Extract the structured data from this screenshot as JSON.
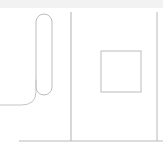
{
  "document": {
    "title": "Line Drawing",
    "width": 163,
    "height": 152,
    "background_color": "#ffffff"
  },
  "style": {
    "stroke_color": "#b9b9b9",
    "stroke_color_dark": "#a8a8a8",
    "stroke_color_light": "#cfcfcf",
    "stroke_width": 1,
    "fill": "none",
    "top_band_color": "#f2f2f2"
  },
  "shapes": {
    "top_band": {
      "name": "top-edge-band",
      "x": 0,
      "y": 0,
      "width": 163,
      "height": 8,
      "color": "#f2f2f2"
    },
    "capsule": {
      "name": "capsule-outline",
      "x": 36,
      "y": 14,
      "width": 16,
      "height": 81,
      "radius": 8,
      "stroke": "#bcbcbc"
    },
    "sweep_curve": {
      "name": "sweeping-curve",
      "path": "M 36 80 L 36 92 Q 36 105 21 105 L 0 105",
      "stroke": "#c4c4c4",
      "start": [
        36,
        80
      ],
      "end": [
        0,
        105
      ]
    },
    "center_vertical_line": {
      "name": "center-vertical-line",
      "x1": 71,
      "y1": 12,
      "x2": 71,
      "y2": 141,
      "stroke": "#b0b0b0"
    },
    "right_vertical_line": {
      "name": "right-vertical-line",
      "x1": 157,
      "y1": 12,
      "x2": 157,
      "y2": 141,
      "stroke": "#b8b8b8"
    },
    "bottom_horizontal_line": {
      "name": "bottom-horizontal-line",
      "x1": 19,
      "y1": 141,
      "x2": 163,
      "y2": 141,
      "stroke": "#b8b8b8"
    },
    "square": {
      "name": "square-outline",
      "x": 101,
      "y": 51,
      "width": 40,
      "height": 41,
      "stroke": "#bcbcbc"
    }
  }
}
